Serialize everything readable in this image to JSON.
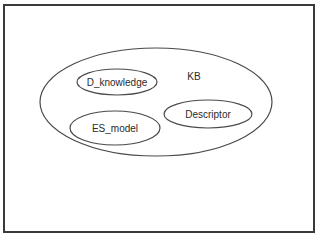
{
  "diagram": {
    "type": "venn-containment",
    "container": {
      "label": "KB",
      "shape": "ellipse"
    },
    "members": [
      {
        "label": "D_knowledge",
        "shape": "ellipse"
      },
      {
        "label": "ES_model",
        "shape": "ellipse"
      },
      {
        "label": "Descriptor",
        "shape": "ellipse"
      }
    ],
    "colors": {
      "stroke": "#4a4a4a",
      "frame": "#3a3a3a",
      "text": "#2a2a2a",
      "background": "#ffffff"
    }
  }
}
